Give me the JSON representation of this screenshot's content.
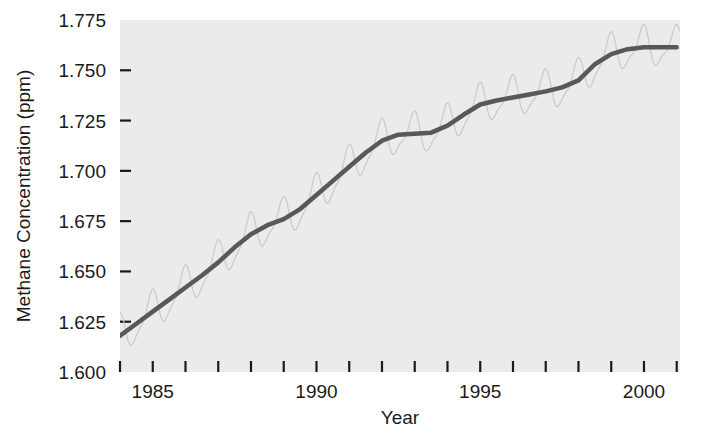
{
  "chart_data": {
    "type": "line",
    "title": "",
    "xlabel": "Year",
    "ylabel": "Methane Concentration (ppm)",
    "xlim": [
      1984.0,
      2001.1
    ],
    "ylim": [
      1.6,
      1.775
    ],
    "grid": false,
    "legend": "none",
    "xticks": [
      1984,
      1985,
      1986,
      1987,
      1988,
      1989,
      1990,
      1991,
      1992,
      1993,
      1994,
      1995,
      1996,
      1997,
      1998,
      1999,
      2000,
      2001
    ],
    "xticklabels": [
      "",
      "1985",
      "",
      "",
      "",
      "",
      "1990",
      "",
      "",
      "",
      "",
      "1995",
      "",
      "",
      "",
      "",
      "2000",
      ""
    ],
    "yticks": [
      1.6,
      1.625,
      1.65,
      1.675,
      1.7,
      1.725,
      1.75,
      1.775
    ],
    "yticklabels": [
      "1.600",
      "1.625",
      "1.650",
      "1.675",
      "1.700",
      "1.725",
      "1.750",
      "1.775"
    ],
    "plot_background_color": "#ebebeb",
    "page_background_color": "#ffffff",
    "series": [
      {
        "name": "trend",
        "style": "thick-dark-line",
        "color": "#585858",
        "linewidth": 4.5,
        "x": [
          1984.0,
          1984.5,
          1985.0,
          1985.5,
          1986.0,
          1986.5,
          1987.0,
          1987.5,
          1988.0,
          1988.5,
          1989.0,
          1989.5,
          1990.0,
          1990.5,
          1991.0,
          1991.5,
          1992.0,
          1992.5,
          1993.0,
          1993.5,
          1994.0,
          1994.5,
          1995.0,
          1995.5,
          1996.0,
          1996.5,
          1997.0,
          1997.5,
          1998.0,
          1998.5,
          1999.0,
          1999.5,
          2000.0,
          2000.5,
          2001.0
        ],
        "y": [
          1.618,
          1.624,
          1.63,
          1.636,
          1.642,
          1.648,
          1.6545,
          1.662,
          1.6685,
          1.673,
          1.676,
          1.681,
          1.688,
          1.695,
          1.702,
          1.709,
          1.715,
          1.718,
          1.7185,
          1.719,
          1.7225,
          1.728,
          1.733,
          1.735,
          1.7365,
          1.738,
          1.7395,
          1.7415,
          1.745,
          1.753,
          1.758,
          1.7605,
          1.7615,
          1.7615,
          1.7615
        ]
      },
      {
        "name": "monthly-seasonal",
        "style": "thin-light-line",
        "color": "#c9c9c9",
        "linewidth": 1.2,
        "seasonal_amplitude_ppm": 0.009,
        "seasonal_period_years": 1.0,
        "description": "monthly observations oscillating about the trend"
      }
    ]
  }
}
